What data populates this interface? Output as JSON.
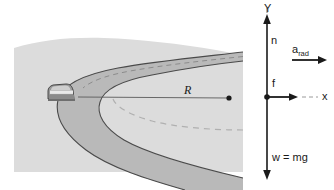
{
  "figure": {
    "name": "car-on-curve-free-body-diagram",
    "type": "physics-diagram"
  },
  "scene": {
    "ground_label": "ground",
    "road_label": "curved-road",
    "car_label": "car",
    "center_dot_label": "center-of-curvature",
    "radius_label": "R"
  },
  "axes": {
    "y_label": "Y",
    "x_label": "x"
  },
  "forces": [
    {
      "symbol": "n",
      "name": "normal-force",
      "direction": "up"
    },
    {
      "symbol": "f",
      "name": "friction-force",
      "direction": "right"
    },
    {
      "symbol": "w = mg",
      "name": "weight-force",
      "direction": "down"
    }
  ],
  "acceleration": {
    "base": "a",
    "subscript": "rad",
    "name": "radial-acceleration",
    "direction": "right"
  },
  "colors": {
    "page_background": "#ffffff",
    "ground": "#dcdcdc",
    "road": "#b9b9b9",
    "road_edge": "#4a4a4a",
    "center_line": "#8c8c8c",
    "path_dash": "#b0b0b0",
    "car_body": "#9a9a9a",
    "car_outline": "#3a3a3a",
    "ink": "#1a1a1a",
    "radius_line": "#5a5a5a"
  }
}
